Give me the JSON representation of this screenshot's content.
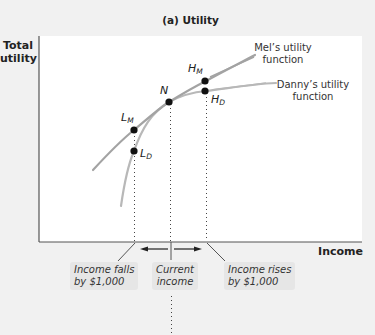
{
  "title": "(a) Utility",
  "axes": {
    "y_label_line1": "Total",
    "y_label_line2": "utility",
    "x_label": "Income"
  },
  "curves": {
    "mel": {
      "label_line1": "Mel’s utility",
      "label_line2": "function",
      "color": "#a3a3a3"
    },
    "danny": {
      "label_line1": "Danny’s utility",
      "label_line2": "function",
      "color": "#b5b5b5"
    }
  },
  "points": {
    "N": {
      "letter": "N",
      "sub": ""
    },
    "H_M": {
      "letter": "H",
      "sub": "M"
    },
    "H_D": {
      "letter": "H",
      "sub": "D"
    },
    "L_M": {
      "letter": "L",
      "sub": "M"
    },
    "L_D": {
      "letter": "L",
      "sub": "D"
    }
  },
  "notes": {
    "falls_line1": "Income falls",
    "falls_line2": "by $1,000",
    "current_line1": "Current",
    "current_line2": "income",
    "rises_line1": "Income rises",
    "rises_line2": "by $1,000"
  },
  "colors": {
    "axis": "#555555",
    "dot": "#111111",
    "note_bg": "#e6e6e6"
  }
}
